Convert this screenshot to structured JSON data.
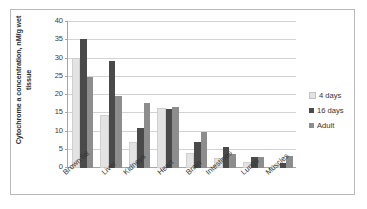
{
  "chart_data": {
    "type": "bar",
    "title": "",
    "xlabel": "",
    "ylabel": "Cytochrome a concentration, nM/g wet tissue",
    "ylabel_lines": [
      "Cytochrome a concentration, nM/g wet",
      "tissue"
    ],
    "ylim": [
      0,
      40
    ],
    "ytick_labels": [
      "0",
      "5",
      "10",
      "15",
      "20",
      "25",
      "30",
      "35",
      "40"
    ],
    "ytick_values": [
      0,
      5,
      10,
      15,
      20,
      25,
      30,
      35,
      40
    ],
    "grid": true,
    "legend_position": "right",
    "categories": [
      "Brown fat",
      "Liver",
      "Kidneys",
      "Heart",
      "Brain",
      "Intestines",
      "Lungs",
      "Muscles"
    ],
    "series": [
      {
        "name": "4 days",
        "color": "#e3e3e3",
        "values": [
          29.5,
          14.0,
          6.5,
          16.0,
          3.7,
          2.3,
          1.0,
          0.4
        ]
      },
      {
        "name": "16 days",
        "color": "#4a4a4a",
        "values": [
          35.3,
          29.4,
          11.0,
          16.2,
          7.0,
          5.7,
          3.1,
          1.5
        ]
      },
      {
        "name": "Adult",
        "color": "#8d8d8d",
        "values": [
          25.0,
          19.8,
          17.7,
          16.6,
          9.9,
          3.8,
          3.0,
          3.2
        ]
      }
    ]
  }
}
